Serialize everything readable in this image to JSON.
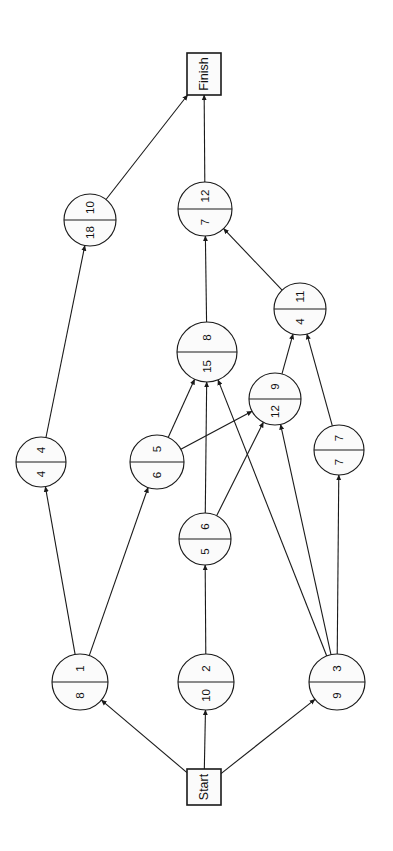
{
  "diagram": {
    "orientation": "rotated-90",
    "terminals": {
      "start": {
        "label": "Start",
        "x": 204,
        "y": 787,
        "w": 34,
        "h": 36
      },
      "finish": {
        "label": "Finish",
        "x": 204,
        "y": 74,
        "w": 34,
        "h": 42
      }
    },
    "nodes": [
      {
        "id": "n1",
        "left": "1",
        "right": "8",
        "cx": 80,
        "cy": 682,
        "r": 28
      },
      {
        "id": "n2",
        "left": "2",
        "right": "10",
        "cx": 206,
        "cy": 682,
        "r": 28
      },
      {
        "id": "n3",
        "left": "3",
        "right": "9",
        "cx": 337,
        "cy": 682,
        "r": 28
      },
      {
        "id": "n4",
        "left": "4",
        "right": "4",
        "cx": 41,
        "cy": 462,
        "r": 25
      },
      {
        "id": "n5",
        "left": "5",
        "right": "6",
        "cx": 157,
        "cy": 462,
        "r": 27
      },
      {
        "id": "n6",
        "left": "6",
        "right": "5",
        "cx": 205,
        "cy": 539,
        "r": 26
      },
      {
        "id": "n7",
        "left": "7",
        "right": "7",
        "cx": 339,
        "cy": 450,
        "r": 25
      },
      {
        "id": "n8",
        "left": "8",
        "right": "15",
        "cx": 207,
        "cy": 352,
        "r": 30
      },
      {
        "id": "n9",
        "left": "9",
        "right": "12",
        "cx": 275,
        "cy": 399,
        "r": 26
      },
      {
        "id": "n10",
        "left": "10",
        "right": "18",
        "cx": 90,
        "cy": 220,
        "r": 26
      },
      {
        "id": "n11",
        "left": "11",
        "right": "4",
        "cx": 300,
        "cy": 309,
        "r": 26
      },
      {
        "id": "n12",
        "left": "12",
        "right": "7",
        "cx": 205,
        "cy": 209,
        "r": 27
      }
    ],
    "edges": [
      {
        "from": "start",
        "to": "n1"
      },
      {
        "from": "start",
        "to": "n2"
      },
      {
        "from": "start",
        "to": "n3"
      },
      {
        "from": "n1",
        "to": "n4"
      },
      {
        "from": "n1",
        "to": "n5"
      },
      {
        "from": "n2",
        "to": "n6"
      },
      {
        "from": "n3",
        "to": "n7"
      },
      {
        "from": "n3",
        "to": "n8"
      },
      {
        "from": "n3",
        "to": "n9"
      },
      {
        "from": "n4",
        "to": "n10"
      },
      {
        "from": "n5",
        "to": "n8"
      },
      {
        "from": "n5",
        "to": "n9"
      },
      {
        "from": "n6",
        "to": "n8"
      },
      {
        "from": "n6",
        "to": "n9"
      },
      {
        "from": "n7",
        "to": "n11"
      },
      {
        "from": "n8",
        "to": "n12"
      },
      {
        "from": "n9",
        "to": "n11"
      },
      {
        "from": "n10",
        "to": "finish"
      },
      {
        "from": "n11",
        "to": "n12"
      },
      {
        "from": "n12",
        "to": "finish"
      }
    ],
    "colors": {
      "stroke": "#1a1a1a",
      "node_fill": "#fbfbfb",
      "background": "#ffffff"
    }
  }
}
